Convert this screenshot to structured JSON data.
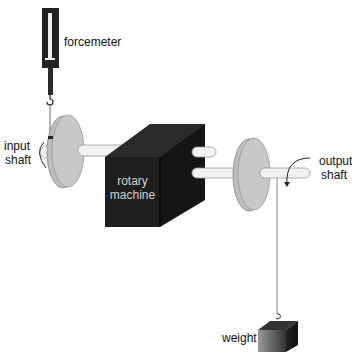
{
  "diagram": {
    "type": "apparatus-diagram",
    "labels": {
      "forcemeter": "forcemeter",
      "input_shaft_line1": "input",
      "input_shaft_line2": "shaft",
      "machine_line1": "rotary",
      "machine_line2": "machine",
      "output_shaft_line1": "output",
      "output_shaft_line2": "shaft",
      "weight": "weight"
    },
    "colors": {
      "machine": "#1e1e1e",
      "disc": "#c8c8c8",
      "shaft": "#f2f2f0",
      "forcemeter": "#222222",
      "weight": "#555555"
    }
  }
}
